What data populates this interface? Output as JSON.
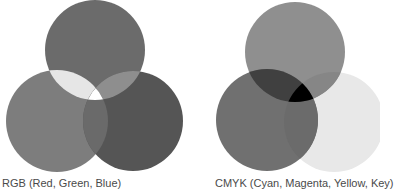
{
  "diagrams": [
    {
      "id": "rgb",
      "caption": "RGB (Red, Green, Blue)",
      "model": "additive",
      "circles": [
        {
          "name": "red",
          "cx": 95,
          "cy": 50,
          "r": 50,
          "fill": "#6b6b6b"
        },
        {
          "name": "green",
          "cx": 57,
          "cy": 121,
          "r": 51,
          "fill": "#7d7d7d"
        },
        {
          "name": "blue",
          "cx": 133,
          "cy": 121,
          "r": 50,
          "fill": "#555555"
        }
      ],
      "overlaps": {
        "top_left": "#e6e6e6",
        "top_right": "#8e8e8e",
        "bottom": "#6a6a6a",
        "center": "#ffffff"
      }
    },
    {
      "id": "cmyk",
      "caption": "CMYK (Cyan, Magenta, Yellow, Key)",
      "model": "subtractive",
      "circles": [
        {
          "name": "magenta",
          "cx": 295,
          "cy": 52,
          "r": 50,
          "fill": "#8f8f8f"
        },
        {
          "name": "cyan",
          "cx": 267,
          "cy": 120,
          "r": 51,
          "fill": "#707070"
        },
        {
          "name": "yellow",
          "cx": 334,
          "cy": 122,
          "r": 50,
          "fill": "#e8e8e8"
        }
      ],
      "overlaps": {
        "top_left": "#404040",
        "top_right": "#868686",
        "bottom": "#6b6b6b",
        "center": "#000000"
      }
    }
  ]
}
